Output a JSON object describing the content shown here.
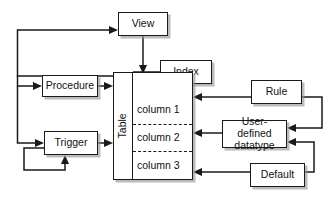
{
  "diagram": {
    "background_color": "#ffffff",
    "line_color": "#1a1a1a",
    "box_fill_color": "#ffffff",
    "shadow_color": "#969696",
    "nodes": {
      "view": {
        "label": "View"
      },
      "index": {
        "label": "Index"
      },
      "procedure": {
        "label": "Procedure"
      },
      "trigger": {
        "label": "Trigger"
      },
      "rule": {
        "label": "Rule"
      },
      "user_defined_datatype": {
        "label": "User-defined\ndatatype"
      },
      "default": {
        "label": "Default"
      },
      "table": {
        "label": "Table",
        "columns": [
          {
            "label": "column 1"
          },
          {
            "label": "column 2"
          },
          {
            "label": "column 3"
          }
        ]
      }
    },
    "connections": [
      {
        "from": "view",
        "to": "table",
        "style": "solid-arrow"
      },
      {
        "from": "table",
        "to": "view",
        "style": "solid-arrow"
      },
      {
        "from": "index",
        "to": "table",
        "style": "solid-line"
      },
      {
        "from": "procedure",
        "to": "table",
        "style": "solid-arrow"
      },
      {
        "from": "table",
        "to": "procedure",
        "style": "solid-arrow"
      },
      {
        "from": "trigger",
        "to": "table",
        "style": "solid-arrow"
      },
      {
        "from": "table",
        "to": "trigger",
        "style": "solid-arrow"
      },
      {
        "from": "trigger",
        "to": "trigger",
        "style": "self-loop-arrow"
      },
      {
        "from": "rule",
        "to": "column 1",
        "style": "solid-arrow"
      },
      {
        "from": "user_defined_datatype",
        "to": "column 2",
        "style": "solid-arrow"
      },
      {
        "from": "default",
        "to": "column 3",
        "style": "solid-arrow"
      },
      {
        "from": "rule",
        "to": "user_defined_datatype",
        "style": "solid-arrow"
      },
      {
        "from": "default",
        "to": "user_defined_datatype",
        "style": "solid-arrow"
      }
    ]
  }
}
